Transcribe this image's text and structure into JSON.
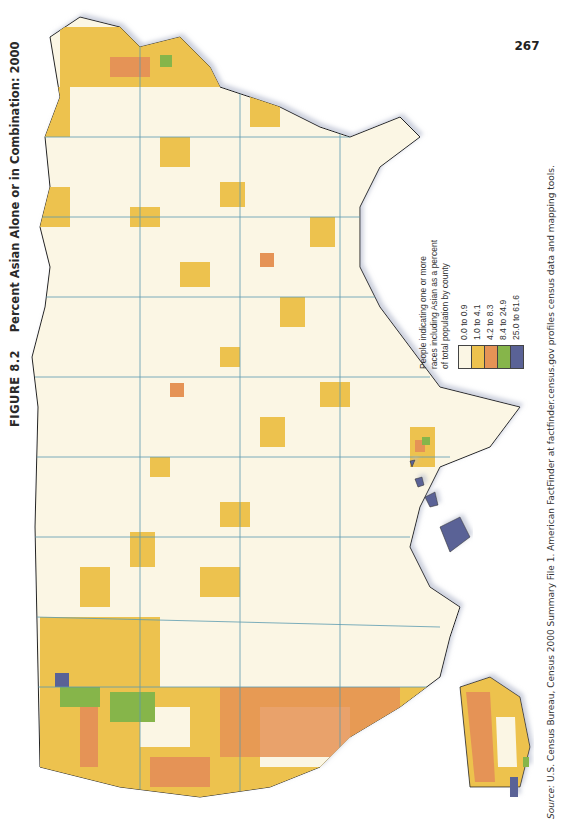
{
  "figure": {
    "number": "FIGURE 8.2",
    "title": "Percent Asian Alone or in Combination: 2000"
  },
  "legend": {
    "title": "People indicating one or more races including Asian as a percent of total population by county",
    "classes": [
      {
        "label": "0.0 to 0.9",
        "color": "#fbf6e4"
      },
      {
        "label": "1.0 to 4.1",
        "color": "#edc24e"
      },
      {
        "label": "4.2 to 8.3",
        "color": "#e59356"
      },
      {
        "label": "8.4 to 24.9",
        "color": "#86b54a"
      },
      {
        "label": "25.0 to 61.6",
        "color": "#5a6296"
      }
    ]
  },
  "source": {
    "prefix": "Source:",
    "text": "U.S. Census Bureau, Census 2000 Summary File 1. American FactFinder at factfinder.census.gov profiles census data and mapping tools."
  },
  "page_number": "267",
  "map": {
    "subject": "United States counties, percent Asian alone or in combination, 2000",
    "insets": [
      "Alaska",
      "Hawaii"
    ],
    "colors": {
      "low": "#fbf6e4",
      "mid": "#edc24e",
      "high": "#e59356",
      "very_high": "#86b54a",
      "max": "#5a6296",
      "state_border": "#5b9bb0",
      "coast": "#222222"
    }
  }
}
